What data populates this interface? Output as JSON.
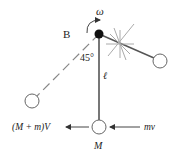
{
  "diagram": {
    "labels": {
      "omega": "ω",
      "pivot": "B",
      "angle": "45°",
      "length": "ℓ",
      "mass": "M",
      "final_momentum": "(M + m)V",
      "incoming_momentum": "mv"
    },
    "colors": {
      "line": "#555555",
      "rod": "#777777",
      "pivot": "#111111",
      "text": "#222222",
      "circle_fill": "#ffffff"
    }
  }
}
